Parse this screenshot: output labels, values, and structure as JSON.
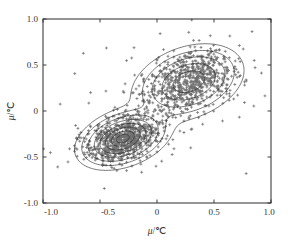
{
  "figure": {
    "background_color": "#ffffff",
    "frame_color": "#2b2b2b",
    "marker_color": "#6f6f6f",
    "contour_color": "#1d1d1d"
  },
  "axis_labels": {
    "x_mu": "μ",
    "x_unit": "/℃",
    "y_mu": "μ",
    "y_unit": "/℃"
  },
  "ticks": {
    "x": [
      "-1.0",
      "-0.5",
      "0",
      "0.5",
      "1.0"
    ],
    "y": [
      "1.0",
      "0.5",
      "0",
      "-0.5",
      "-1.0"
    ]
  },
  "chart_data": {
    "type": "scatter",
    "title": "",
    "xlabel": "μ/℃",
    "ylabel": "μ/℃",
    "xlim": [
      -1.0,
      1.0
    ],
    "ylim": [
      -1.0,
      1.0
    ],
    "xticks": [
      -1.0,
      -0.5,
      0.0,
      0.5,
      1.0
    ],
    "yticks": [
      -1.0,
      -0.5,
      0.0,
      0.5,
      1.0
    ],
    "xticklabels": [
      "-1.0",
      "-0.5",
      "0",
      "0.5",
      "1.0"
    ],
    "yticklabels": [
      "-1.0",
      "-0.5",
      "0",
      "0.5",
      "1.0"
    ],
    "grid": false,
    "legend": null,
    "marker": "+",
    "marker_color": "#6f6f6f",
    "n_points": 1600,
    "overlay": {
      "type": "density_contours",
      "style": "kde",
      "color": "#1d1d1d",
      "n_levels": 6,
      "shape": "bimodal peanut / figure-eight joining two modes"
    },
    "clusters": [
      {
        "name": "lower-left mode",
        "center": [
          -0.3,
          -0.3
        ],
        "sigma_x": 0.16,
        "sigma_y": 0.13,
        "rho": 0.35,
        "weight": 0.47
      },
      {
        "name": "upper-right mode",
        "center": [
          0.28,
          0.32
        ],
        "sigma_x": 0.2,
        "sigma_y": 0.17,
        "rho": 0.3,
        "weight": 0.45
      },
      {
        "name": "diffuse outliers",
        "center": [
          0.0,
          0.0
        ],
        "sigma_x": 0.46,
        "sigma_y": 0.44,
        "rho": 0.45,
        "weight": 0.08
      }
    ],
    "contour_levels_lower_left": [
      {
        "level": 0.96,
        "rx": 0.03,
        "ry": 0.024
      },
      {
        "level": 0.8,
        "rx": 0.072,
        "ry": 0.058
      },
      {
        "level": 0.62,
        "rx": 0.12,
        "ry": 0.096
      },
      {
        "level": 0.44,
        "rx": 0.172,
        "ry": 0.14
      },
      {
        "level": 0.28,
        "rx": 0.238,
        "ry": 0.192
      },
      {
        "level": 0.14,
        "rx": 0.32,
        "ry": 0.262
      }
    ],
    "contour_levels_upper_right": [
      {
        "level": 0.82,
        "rx": 0.075,
        "ry": 0.062
      },
      {
        "level": 0.64,
        "rx": 0.15,
        "ry": 0.124
      },
      {
        "level": 0.46,
        "rx": 0.228,
        "ry": 0.188
      },
      {
        "level": 0.3,
        "rx": 0.3,
        "ry": 0.25
      },
      {
        "level": 0.16,
        "rx": 0.372,
        "ry": 0.312
      }
    ]
  }
}
